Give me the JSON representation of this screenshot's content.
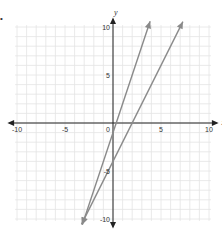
{
  "marker": "•",
  "chart_data": {
    "type": "line",
    "title": "",
    "xlabel": "x",
    "ylabel": "y",
    "xlim": [
      -10,
      10
    ],
    "ylim": [
      -10,
      10
    ],
    "grid": true,
    "x_ticks": [
      "-10",
      "-5",
      "0",
      "5",
      "10"
    ],
    "y_ticks": [
      "10",
      "5",
      "-5",
      "-10"
    ],
    "origin_label": "0",
    "series": [
      {
        "name": "line-1",
        "equation": "y = 3x - 1",
        "x": [
          -3,
          3.67
        ],
        "y": [
          -10,
          10
        ],
        "color": "#8a8a8a"
      },
      {
        "name": "line-2",
        "equation": "y = 2x - 4",
        "x": [
          -3,
          7
        ],
        "y": [
          -10,
          10
        ],
        "color": "#8a8a8a"
      }
    ],
    "colors": {
      "grid": "#e4e4e4",
      "axis": "#222222",
      "line": "#8a8a8a"
    }
  }
}
